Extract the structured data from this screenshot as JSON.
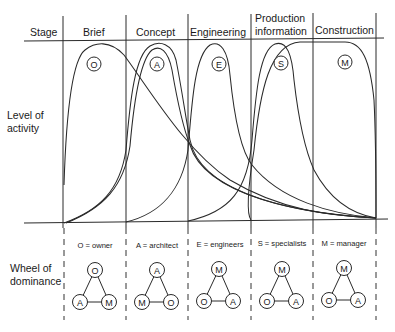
{
  "header": {
    "stage_label": "Stage",
    "stages": [
      "Brief",
      "Concept",
      "Engineering",
      "Production information",
      "Construction"
    ],
    "stage_lines": [
      [
        "Brief"
      ],
      [
        "Concept"
      ],
      [
        "Engineering"
      ],
      [
        "Production",
        "information"
      ],
      [
        "Construction"
      ]
    ]
  },
  "y_axis_label": [
    "Level of",
    "activity"
  ],
  "curves": [
    {
      "id": "O",
      "party": "owner",
      "peak_stage": "Brief"
    },
    {
      "id": "A",
      "party": "architect",
      "peak_stage": "Concept"
    },
    {
      "id": "E",
      "party": "engineers",
      "peak_stage": "Engineering"
    },
    {
      "id": "S",
      "party": "specialists",
      "peak_stage": "Production information"
    },
    {
      "id": "M",
      "party": "manager",
      "peak_stage": "Construction"
    }
  ],
  "wheel": {
    "label": [
      "Wheel of",
      "dominance"
    ],
    "keys": [
      "O = owner",
      "A = architect",
      "E = engineers",
      "S = specialists",
      "M = manager"
    ],
    "triangles": [
      {
        "top": "O",
        "left": "A",
        "right": "M"
      },
      {
        "top": "A",
        "left": "M",
        "right": "O"
      },
      {
        "top": "M",
        "left": "O",
        "right": "A"
      },
      {
        "top": "M",
        "left": "O",
        "right": "A"
      },
      {
        "top": "M",
        "left": "O",
        "right": "A"
      }
    ]
  }
}
